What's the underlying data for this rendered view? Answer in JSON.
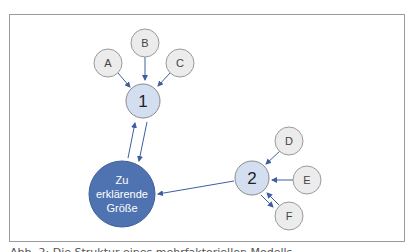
{
  "diagram": {
    "nodes": {
      "A": {
        "label": "A"
      },
      "B": {
        "label": "B"
      },
      "C": {
        "label": "C"
      },
      "D": {
        "label": "D"
      },
      "E": {
        "label": "E"
      },
      "F": {
        "label": "F"
      },
      "n1": {
        "label": "1"
      },
      "n2": {
        "label": "2"
      },
      "target": {
        "line1": "Zu",
        "line2": "erklärende",
        "line3": "Größe"
      }
    },
    "edges": [
      {
        "from": "A",
        "to": "1"
      },
      {
        "from": "B",
        "to": "1"
      },
      {
        "from": "C",
        "to": "1"
      },
      {
        "from": "1",
        "to": "Zu erklärende Größe"
      },
      {
        "from": "Zu erklärende Größe",
        "to": "1"
      },
      {
        "from": "D",
        "to": "2"
      },
      {
        "from": "E",
        "to": "2"
      },
      {
        "from": "F",
        "to": "2"
      },
      {
        "from": "2",
        "to": "F"
      },
      {
        "from": "2",
        "to": "Zu erklärende Größe"
      }
    ],
    "colors": {
      "factor_fill": "#ececec",
      "factor_stroke": "#9a9a9a",
      "mediator_fill": "#d3dff0",
      "target_fill": "#4f73b0",
      "arrow": "#3d5fa0"
    }
  },
  "caption": {
    "text": "Abb. 2: Die Struktur eines mehrfaktoriellen Modells"
  }
}
